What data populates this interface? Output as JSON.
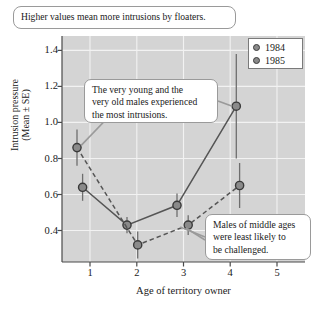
{
  "chart_data": {
    "type": "line",
    "title": "",
    "xlabel": "Age of territory owner",
    "ylabel_line1": "Intrusion pressure",
    "ylabel_line2": "(Mean ± SE)",
    "xlim": [
      0.4,
      5.6
    ],
    "ylim": [
      0.225,
      1.48
    ],
    "xticks": [
      1,
      2,
      3,
      4,
      5
    ],
    "xtick_labels": [
      "1",
      "2",
      "3",
      "4",
      "5"
    ],
    "yticks": [
      0.4,
      0.6,
      0.8,
      1.0,
      1.2,
      1.4
    ],
    "ytick_labels": [
      "0.4",
      "0.6",
      "0.8",
      "1.0",
      "1.2",
      "1.4"
    ],
    "grid": true,
    "grid_color": "#f2f2f2",
    "plot_background": "#d4d4d4",
    "legend_position": "top-right",
    "series": [
      {
        "name": "1984",
        "line_style": "solid",
        "color": "#555555",
        "marker_fill": "#8a8a8a",
        "x": [
          0.84,
          1.79,
          2.86,
          4.13
        ],
        "values": [
          0.64,
          0.43,
          0.54,
          1.09
        ],
        "error": [
          0.075,
          0.045,
          0.065,
          0.29
        ]
      },
      {
        "name": "1985",
        "line_style": "dashed",
        "color": "#555555",
        "marker_fill": "#8a8a8a",
        "x": [
          0.72,
          2.02,
          3.1,
          4.2
        ],
        "values": [
          0.86,
          0.32,
          0.43,
          0.65
        ],
        "error": [
          0.1,
          0.075,
          0.055,
          0.125
        ]
      }
    ]
  },
  "legend": {
    "items": [
      {
        "label": "1984"
      },
      {
        "label": "1985"
      }
    ]
  },
  "annotations": {
    "top": {
      "lines": [
        "Higher values mean more intrusions by floaters."
      ]
    },
    "middle": {
      "lines": [
        "The very young and the",
        "very old males experienced",
        "the most intrusions."
      ]
    },
    "bottom": {
      "lines": [
        "Males of middle ages",
        "were least likely to",
        "be challenged."
      ]
    }
  }
}
